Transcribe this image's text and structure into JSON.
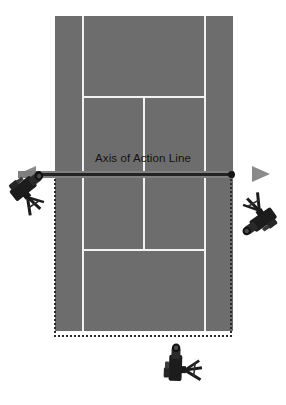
{
  "caption": {
    "text": "one side of the line."
  },
  "diagram": {
    "title": "Axis of Action Line",
    "axis_label": "Axis of Action Line",
    "court": {
      "surface_color": "#6d6d6d",
      "line_color": "#f2f2f2",
      "type": "tennis-court-overhead",
      "features": [
        "left-singles-sideline",
        "right-singles-sideline",
        "top-service-line",
        "bottom-service-line",
        "center-service-line",
        "net-line",
        "left-doubles-alley",
        "right-doubles-alley"
      ]
    },
    "axis": {
      "label": "Axis of Action Line",
      "arrow_color": "#8a8a8a",
      "line_color": "#232323",
      "direction": "bidirectional-horizontal"
    },
    "valid_zone": {
      "style": "dotted",
      "color": "#2a2a2a",
      "description": "valid camera placement region below axis of action"
    },
    "cameras": [
      {
        "id": "camera-left",
        "position": "left",
        "rotation": -38,
        "inside_zone": true
      },
      {
        "id": "camera-right",
        "position": "right",
        "rotation": 34,
        "inside_zone": true
      },
      {
        "id": "camera-bottom",
        "position": "bottom",
        "rotation": 0,
        "inside_zone": true
      }
    ]
  }
}
